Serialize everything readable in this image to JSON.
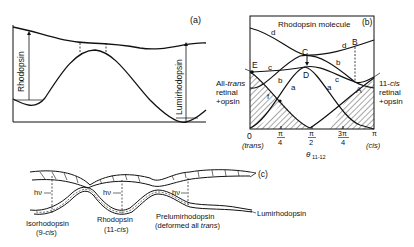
{
  "panel_a": {
    "tag": "(a)",
    "left_arrow_label": "Rhodopsin",
    "right_arrow_label": "Lumirhodopsin"
  },
  "panel_b": {
    "tag": "(b)",
    "title": "Rhodopsin molecule",
    "points": [
      "E",
      "C",
      "D",
      "B",
      "A"
    ],
    "curve_labels": {
      "d1": "d",
      "d2": "d",
      "c1": "c",
      "c2": "c",
      "b1": "b",
      "b2": "b",
      "a1": "a",
      "a2": "a",
      "f": "f"
    },
    "left_label": [
      "All-",
      "trans",
      "retinal",
      "+opsin"
    ],
    "right_label": [
      "11-",
      "cis",
      "retinal",
      "+opsin"
    ],
    "x_ticks": [
      "0",
      "π/4",
      "π/2",
      "3π/4",
      "π"
    ],
    "x_tick_top": [
      "0",
      "π",
      "π",
      "3π",
      "π"
    ],
    "x_tick_bottom": [
      "",
      "4",
      "2",
      "4",
      ""
    ],
    "x_sub_left": "(trans)",
    "x_sub_right": "(cis)",
    "x_axis_label": "θ",
    "x_axis_sub": "11-12"
  },
  "panel_c": {
    "tag": "(c)",
    "hv": "hν",
    "labels": {
      "iso": "Isorhodopsin",
      "iso_sub": "(9-cis)",
      "rho": "Rhodopsin",
      "rho_sub": "(11-cis)",
      "prelumi": "Prelumirhodopsin",
      "prelumi_sub": "(deformed all trans)",
      "lumi": "Lumirhodopsin"
    }
  }
}
